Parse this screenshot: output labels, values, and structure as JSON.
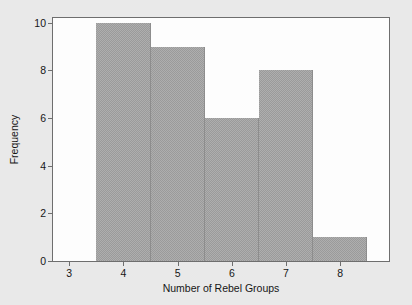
{
  "chart_data": {
    "type": "bar",
    "title": "",
    "xlabel": "Number of Rebel Groups",
    "ylabel": "Frequency",
    "xlim": [
      2.7,
      8.9
    ],
    "ylim": [
      0,
      10.2
    ],
    "grid": false,
    "legend": false,
    "bar_color": "#9a9a9a",
    "background_color": "#e9e9e9",
    "plot_background_color": "#fdfdfd",
    "axis_color": "#6e6e6e",
    "xticks": [
      3,
      4,
      5,
      6,
      7,
      8
    ],
    "xtick_labels": [
      "3",
      "4",
      "5",
      "6",
      "7",
      "8"
    ],
    "yticks": [
      0,
      2,
      4,
      6,
      8,
      10
    ],
    "ytick_labels": [
      "0",
      "2",
      "4",
      "6",
      "8",
      "10"
    ],
    "categories": [
      "3.5-4.5",
      "4.5-5.5",
      "5.5-6.5",
      "6.5-7.5",
      "7.5-8.5"
    ],
    "bin_edges": [
      3.5,
      4.5,
      5.5,
      6.5,
      7.5,
      8.5
    ],
    "bin_centers": [
      4,
      5,
      6,
      7,
      8
    ],
    "values": [
      10,
      9,
      6,
      8,
      1
    ]
  }
}
